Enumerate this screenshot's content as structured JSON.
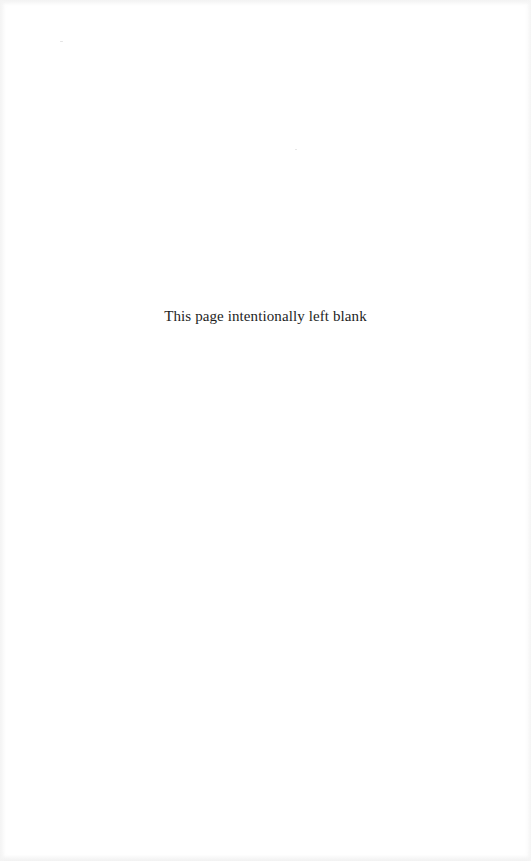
{
  "page": {
    "notice_text": "This page intentionally left blank",
    "background_color": "#ffffff",
    "text_color": "#1e1e1e"
  }
}
